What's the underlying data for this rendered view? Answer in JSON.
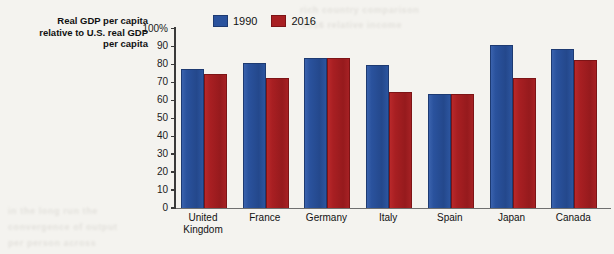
{
  "axis_title": {
    "line1": "Real GDP per capita",
    "line2": "relative to U.S. real GDP",
    "line3": "per capita"
  },
  "legend": {
    "items": [
      {
        "label": "1990",
        "color": "#2a529d"
      },
      {
        "label": "2016",
        "color": "#a81f22"
      }
    ]
  },
  "y_axis": {
    "ticks": [
      "100%",
      "90",
      "80",
      "70",
      "60",
      "50",
      "40",
      "30",
      "20",
      "10",
      "0"
    ]
  },
  "bleed_text": {
    "t1": "rich country comparison",
    "t2": "2016 relative income",
    "t3": "in the long run the",
    "t4": "convergence of output",
    "t5": "per person across"
  },
  "chart_data": {
    "type": "bar",
    "title": "Real GDP per capita relative to U.S. real GDP per capita",
    "xlabel": "",
    "ylabel": "Real GDP per capita relative to U.S. real GDP per capita",
    "ylim": [
      0,
      100
    ],
    "yticks": [
      0,
      10,
      20,
      30,
      40,
      50,
      60,
      70,
      80,
      90,
      100
    ],
    "grid": false,
    "legend_position": "top-left-inside",
    "categories": [
      "United Kingdom",
      "France",
      "Germany",
      "Italy",
      "Spain",
      "Japan",
      "Canada"
    ],
    "category_labels": [
      [
        "United",
        "Kingdom"
      ],
      [
        "France"
      ],
      [
        "Germany"
      ],
      [
        "Italy"
      ],
      [
        "Spain"
      ],
      [
        "Japan"
      ],
      [
        "Canada"
      ]
    ],
    "series": [
      {
        "name": "1990",
        "color": "#2a529d",
        "values": [
          77,
          80,
          83,
          79,
          63,
          90,
          88
        ]
      },
      {
        "name": "2016",
        "color": "#a81f22",
        "values": [
          74,
          72,
          83,
          64,
          63,
          72,
          82
        ]
      }
    ]
  }
}
